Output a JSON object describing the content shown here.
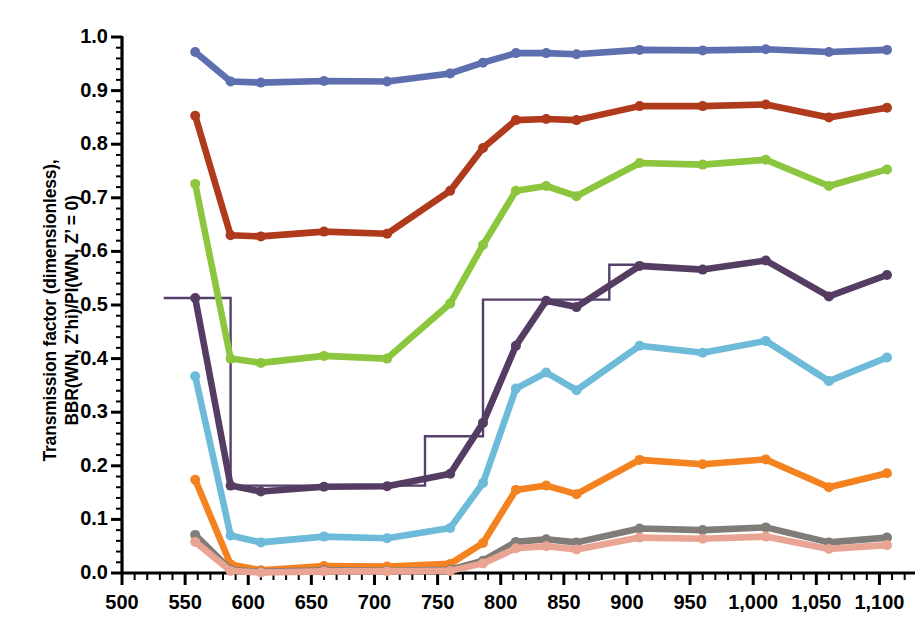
{
  "chart_data": {
    "type": "line",
    "title": "",
    "xlabel": "",
    "ylabel": "Transmission factor (dimensionless), BBR(WN, Z'hi)/PI(WN, Z' = 0)",
    "ylabel_line1": "Transmission factor (dimensionless),",
    "ylabel_line2": "BBR(WN, Z’hi)/PI(WN, Z’ = 0)",
    "xlim": [
      500,
      1125
    ],
    "ylim": [
      0.0,
      1.0
    ],
    "grid": false,
    "legend": "none",
    "x_major_step": 50,
    "x_minor_step": 10,
    "y_major_step": 0.1,
    "y_minor_step": 0.02,
    "xticks": [
      500,
      550,
      600,
      650,
      700,
      750,
      800,
      850,
      900,
      950,
      1000,
      1050,
      1100
    ],
    "xtick_labels": [
      "500",
      "550",
      "600",
      "650",
      "700",
      "750",
      "800",
      "850",
      "900",
      "950",
      "1,000",
      "1,050",
      "1,100"
    ],
    "yticks": [
      0.0,
      0.1,
      0.2,
      0.3,
      0.4,
      0.5,
      0.6,
      0.7,
      0.8,
      0.9,
      1.0
    ],
    "ytick_labels": [
      "0.0",
      "0.1",
      "0.2",
      "0.3",
      "0.4",
      "0.5",
      "0.6",
      "0.7",
      "0.8",
      "0.9",
      "1.0"
    ],
    "x": [
      558,
      586,
      610,
      660,
      710,
      760,
      786,
      812,
      836,
      860,
      910,
      960,
      1010,
      1060,
      1106
    ],
    "series": [
      {
        "name": "series-blue",
        "color": "#5D6FAF",
        "marker": "circle",
        "values": [
          0.972,
          0.917,
          0.915,
          0.918,
          0.917,
          0.932,
          0.952,
          0.97,
          0.97,
          0.968,
          0.976,
          0.975,
          0.977,
          0.972,
          0.976
        ]
      },
      {
        "name": "series-darkred",
        "color": "#B03A1C",
        "marker": "circle",
        "values": [
          0.853,
          0.63,
          0.628,
          0.637,
          0.633,
          0.713,
          0.793,
          0.845,
          0.847,
          0.845,
          0.871,
          0.871,
          0.874,
          0.85,
          0.868
        ]
      },
      {
        "name": "series-green",
        "color": "#8CC63E",
        "marker": "circle",
        "values": [
          0.726,
          0.4,
          0.392,
          0.405,
          0.4,
          0.503,
          0.612,
          0.713,
          0.722,
          0.703,
          0.765,
          0.762,
          0.771,
          0.722,
          0.753
        ]
      },
      {
        "name": "series-purple",
        "color": "#543C63",
        "marker": "circle",
        "values": [
          0.513,
          0.163,
          0.152,
          0.161,
          0.162,
          0.185,
          0.28,
          0.424,
          0.508,
          0.496,
          0.573,
          0.566,
          0.583,
          0.516,
          0.556
        ]
      },
      {
        "name": "series-lightblue",
        "color": "#6DBAD9",
        "marker": "circle",
        "values": [
          0.367,
          0.07,
          0.057,
          0.068,
          0.065,
          0.084,
          0.168,
          0.344,
          0.374,
          0.341,
          0.424,
          0.411,
          0.433,
          0.358,
          0.402
        ]
      },
      {
        "name": "series-orange",
        "color": "#F58220",
        "marker": "circle",
        "values": [
          0.174,
          0.016,
          0.005,
          0.013,
          0.012,
          0.017,
          0.056,
          0.155,
          0.163,
          0.147,
          0.211,
          0.203,
          0.212,
          0.16,
          0.186
        ]
      },
      {
        "name": "series-gray",
        "color": "#807D78",
        "marker": "circle",
        "values": [
          0.071,
          0.006,
          0.002,
          0.005,
          0.004,
          0.006,
          0.023,
          0.058,
          0.063,
          0.057,
          0.083,
          0.08,
          0.085,
          0.057,
          0.066
        ]
      },
      {
        "name": "series-pink",
        "color": "#EAA493",
        "marker": "circle",
        "values": [
          0.058,
          0.004,
          0.001,
          0.003,
          0.003,
          0.004,
          0.018,
          0.046,
          0.05,
          0.044,
          0.066,
          0.064,
          0.068,
          0.045,
          0.052
        ]
      }
    ],
    "step_series": {
      "name": "series-step",
      "color": "#54406B",
      "style": "thin-step",
      "x_edges": [
        533,
        586,
        740,
        786,
        886,
        908
      ],
      "levels": [
        0.513,
        0.163,
        0.255,
        0.51,
        0.575
      ]
    }
  }
}
